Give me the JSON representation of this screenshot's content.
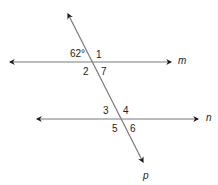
{
  "diagram": {
    "type": "parallel lines cut by a transversal",
    "line_color": "#7a7a7a",
    "arrow_color": "#1a1a1a",
    "lines": [
      {
        "name": "m",
        "x1": 8,
        "y1": 62,
        "x2": 173,
        "y2": 62
      },
      {
        "name": "n",
        "x1": 35,
        "y1": 119,
        "x2": 200,
        "y2": 119
      },
      {
        "name": "p",
        "x1": 67,
        "y1": 12,
        "x2": 144,
        "y2": 164
      }
    ],
    "line_labels": {
      "m": "m",
      "n": "n",
      "p": "p"
    },
    "angle_labels": {
      "given": "62°",
      "a1": "1",
      "a2": "2",
      "a7": "7",
      "a3": "3",
      "a4": "4",
      "a5": "5",
      "a6": "6"
    }
  }
}
